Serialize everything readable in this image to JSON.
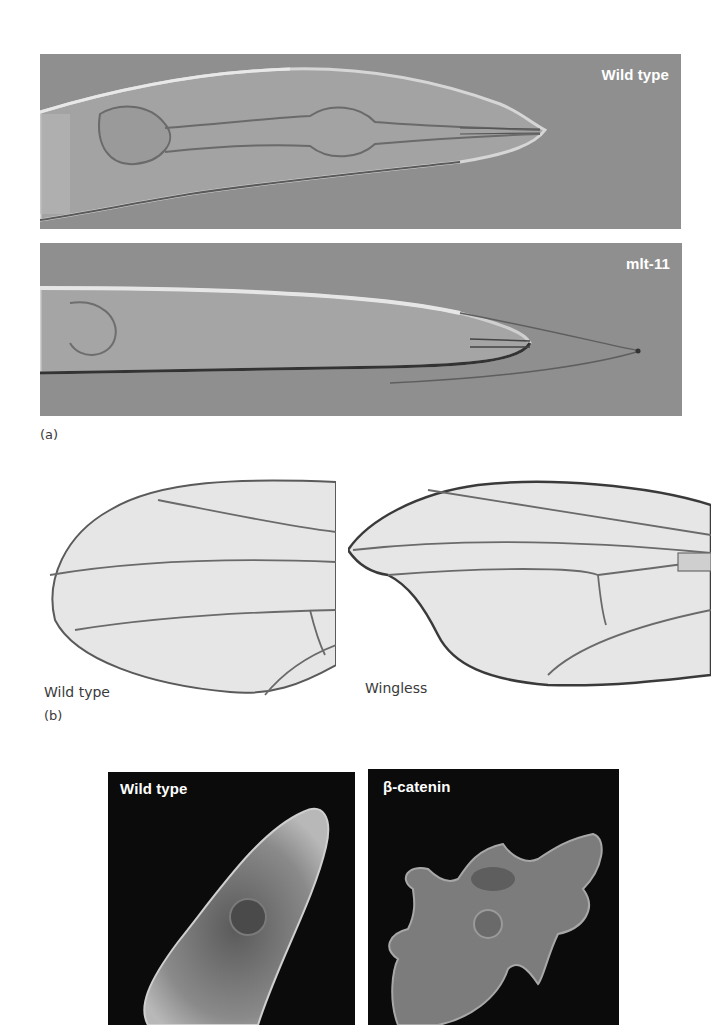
{
  "figure": {
    "panel_a": {
      "label": "(a)",
      "top_image": {
        "label": "Wild type",
        "subject": "C. elegans head, wild type (DIC micrograph)"
      },
      "bottom_image": {
        "label": "mlt-11",
        "subject": "C. elegans head, mlt-11 mutant with unshed cuticle (DIC micrograph)"
      },
      "colors": {
        "background": "#8f8f8f",
        "label_text": "#ffffff"
      }
    },
    "panel_b": {
      "label": "(b)",
      "left_image": {
        "caption": "Wild type",
        "subject": "Drosophila wing, wild type"
      },
      "right_image": {
        "caption": "Wingless",
        "subject": "Drosophila wing, Wingless mutant with notched margin"
      },
      "colors": {
        "wing_fill": "#e6e6e6",
        "vein": "#5a5a5a"
      }
    },
    "panel_c": {
      "left_image": {
        "label": "Wild type",
        "subject": "Cell, wild type (fluorescence micrograph)"
      },
      "right_image": {
        "label": "β-catenin",
        "subject": "Cell, β-catenin mutant with irregular shape (fluorescence micrograph)"
      },
      "colors": {
        "background": "#0b0b0b",
        "label_text": "#ffffff"
      }
    }
  }
}
